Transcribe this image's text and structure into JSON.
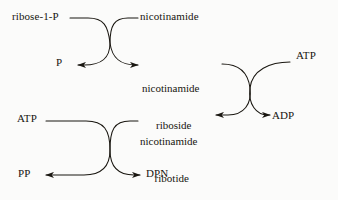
{
  "diagram": {
    "type": "biochemical-pathway",
    "stroke_color": "#191610",
    "background_color": "#fbfbfa",
    "labels": {
      "ribose_1_p": "ribose-1-P",
      "nicotinamide": "nicotinamide",
      "phosphate": "P",
      "nicotinamide_riboside_line1": "nicotinamide",
      "nicotinamide_riboside_line2": "riboside",
      "atp_right": "ATP",
      "atp_left": "ATP",
      "nicotinamide_ribotide_line1": "nicotinamide",
      "nicotinamide_ribotide_line2": "ribotide",
      "adp": "ADP",
      "pp": "PP",
      "dpn": "DPN"
    },
    "reactions": [
      {
        "name": "phosphorolysis",
        "substrate": "ribose-1-P",
        "cosubstrate": "nicotinamide",
        "product": "nicotinamide riboside",
        "coproduct": "P"
      },
      {
        "name": "phosphorylation",
        "substrate": "nicotinamide riboside",
        "cosubstrate": "ATP",
        "product": "nicotinamide ribotide",
        "coproduct": "ADP"
      },
      {
        "name": "adenylylation",
        "substrate": "nicotinamide ribotide",
        "cosubstrate": "ATP",
        "product": "DPN",
        "coproduct": "PP"
      }
    ]
  }
}
